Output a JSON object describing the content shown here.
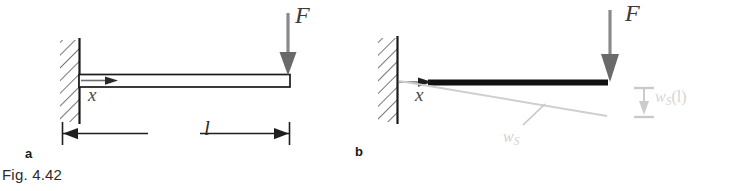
{
  "figure": {
    "caption": "Fig. 4.42",
    "type": "cantilever-beam-deflection-diagram",
    "background_color": "#ffffff"
  },
  "panels": [
    {
      "id": "a",
      "label": "a",
      "description": "Undeformed cantilever beam clamped at left wall, tip load F at right end",
      "beam_style": "hollow-outline",
      "labels": {
        "force": "F",
        "axis": "x",
        "length": "l"
      },
      "dimension_line": {
        "label": "l",
        "arrow_left": true,
        "arrow_right": true
      }
    },
    {
      "id": "b",
      "label": "b",
      "description": "Deformed cantilever beam: rigid black beam with gray shear deflection line w_S below",
      "beam_style": "solid-thick-black",
      "labels": {
        "force": "F",
        "axis": "x",
        "deflection_curve": "w",
        "deflection_curve_sub": "S",
        "tip_deflection": "w",
        "tip_deflection_sub": "S",
        "tip_deflection_arg": "(l)"
      }
    }
  ],
  "colors": {
    "beam_dark": "#111111",
    "beam_outline": "#1a1a1a",
    "arrow_gray": "#7d7d7d",
    "deflection_gray": "#cfcfcf",
    "hatch_gray": "#555555",
    "text_dark": "#2b2b2b",
    "caption_color": "#2b2b2b"
  },
  "icons": {
    "force_arrow": "down-arrow-icon",
    "axis_arrow": "right-arrow-icon",
    "dimension_arrow": "double-arrow-icon",
    "wall_hatch": "fixed-support-hatch-icon",
    "deflection_measure": "vertical-dimension-arrow-icon"
  }
}
